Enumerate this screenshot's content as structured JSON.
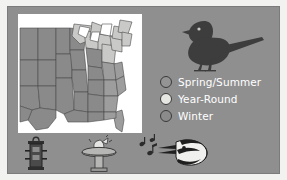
{
  "slide": {
    "background_color": "#8f8f8f",
    "page_color": "#f2f2f0"
  },
  "map": {
    "name": "range-map-eastern-united-states",
    "region": "Eastern and Central United States",
    "ocean_color": "#ffffff",
    "land_spring_summer_color": "#8a8a8a",
    "land_year_round_color": "#c9c9c7",
    "land_winter_color": "#9d9d9d",
    "border_color": "#4a4a4a"
  },
  "bird": {
    "name": "dark-eyed-junco-silhouette",
    "color": "#3d3d3d",
    "facing": "left"
  },
  "legend": {
    "items": [
      {
        "label": "Spring/Summer",
        "color": "#949494",
        "swatch": "spring"
      },
      {
        "label": "Year-Round",
        "color": "#e6e6e2",
        "swatch": "yearround"
      },
      {
        "label": "Winter",
        "color": "#8b8b8b",
        "swatch": "winter"
      }
    ],
    "text_color": "#ffffff"
  },
  "icons": [
    {
      "name": "bird-feeder-icon",
      "label": "Bird feeder"
    },
    {
      "name": "birdbath-icon",
      "label": "Birdbath"
    },
    {
      "name": "singing-bird-icon",
      "label": "Singing bird with music notes"
    }
  ]
}
